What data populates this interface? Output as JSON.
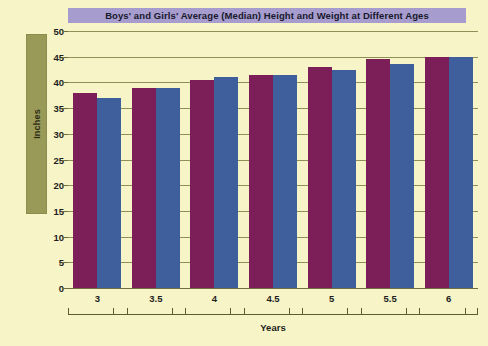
{
  "chart_data": {
    "type": "bar",
    "title": "Boys' and Girls' Average (Median) Height and Weight at Different Ages",
    "xlabel": "Years",
    "ylabel": "Inches",
    "categories": [
      "3",
      "3.5",
      "4",
      "4.5",
      "5",
      "5.5",
      "6"
    ],
    "series": [
      {
        "name": "Boys",
        "color": "#7c1f58",
        "values": [
          38,
          39,
          40.5,
          41.5,
          43,
          44.5,
          45
        ]
      },
      {
        "name": "Girls",
        "color": "#3f5e9c",
        "values": [
          37,
          39,
          41,
          41.5,
          42.5,
          43.5,
          45
        ]
      }
    ],
    "ylim": [
      0,
      50
    ],
    "yticks": [
      "50",
      "45",
      "40",
      "35",
      "30",
      "25",
      "20",
      "15",
      "10",
      "5",
      "0"
    ],
    "ytick_values": [
      50,
      45,
      40,
      35,
      30,
      25,
      20,
      15,
      10,
      5,
      0
    ],
    "grid": true,
    "legend": "none",
    "background_color": "#f7f5c8",
    "title_band_color": "#a69ccd",
    "axis_band_color": "#9a9a58"
  }
}
